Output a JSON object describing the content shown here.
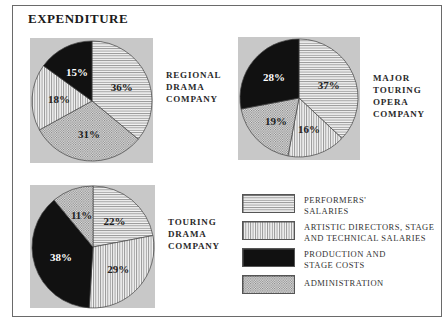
{
  "title": "EXPENDITURE",
  "categories_legend": [
    {
      "key": "performers",
      "label_line1": "PERFORMERS'",
      "label_line2": "SALARIES",
      "pattern": "horizontal-lines"
    },
    {
      "key": "artistic",
      "label_line1": "ARTISTIC DIRECTORS, STAGE",
      "label_line2": "AND TECHNICAL SALARIES",
      "pattern": "vertical-lines"
    },
    {
      "key": "production",
      "label_line1": "PRODUCTION AND",
      "label_line2": "STAGE COSTS",
      "pattern": "solid-black"
    },
    {
      "key": "administration",
      "label_line1": "ADMINISTRATION",
      "label_line2": "",
      "pattern": "dots"
    }
  ],
  "pies": [
    {
      "label_lines": [
        "REGIONAL",
        "DRAMA",
        "COMPANY"
      ]
    },
    {
      "label_lines": [
        "MAJOR",
        "TOURING",
        "OPERA",
        "COMPANY"
      ]
    },
    {
      "label_lines": [
        "TOURING",
        "DRAMA",
        "COMPANY"
      ]
    }
  ],
  "colors": {
    "background_square": "#c8c8c8",
    "production": "#111111",
    "frame": "#6a6a6a"
  },
  "chart_data": [
    {
      "type": "pie",
      "title": "Regional Drama Company",
      "categories": [
        "Performers' salaries",
        "Administration",
        "Artistic directors, stage and technical salaries",
        "Production and stage costs"
      ],
      "values": [
        36,
        31,
        18,
        15
      ],
      "labels": [
        "36%",
        "31%",
        "18%",
        "15%"
      ]
    },
    {
      "type": "pie",
      "title": "Major Touring Opera Company",
      "categories": [
        "Performers' salaries",
        "Artistic directors, stage and technical salaries",
        "Administration",
        "Production and stage costs"
      ],
      "values": [
        37,
        16,
        19,
        28
      ],
      "labels": [
        "37%",
        "16%",
        "19%",
        "28%"
      ]
    },
    {
      "type": "pie",
      "title": "Touring Drama Company",
      "categories": [
        "Performers' salaries",
        "Artistic directors, stage and technical salaries",
        "Production and stage costs",
        "Administration"
      ],
      "values": [
        22,
        29,
        38,
        11
      ],
      "labels": [
        "22%",
        "29%",
        "38%",
        "11%"
      ]
    }
  ]
}
